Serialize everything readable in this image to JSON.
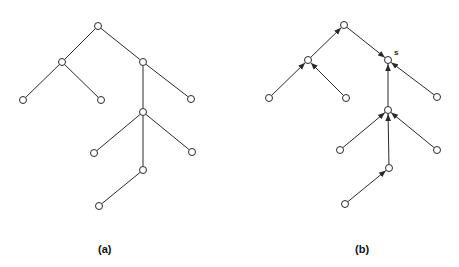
{
  "figure": {
    "panels": [
      {
        "id": "a",
        "caption": "(a)",
        "directed": false,
        "nodes": [
          {
            "id": "r",
            "x": 98,
            "y": 26
          },
          {
            "id": "l",
            "x": 62,
            "y": 62
          },
          {
            "id": "c",
            "x": 143,
            "y": 62
          },
          {
            "id": "ll",
            "x": 23,
            "y": 100
          },
          {
            "id": "lr",
            "x": 101,
            "y": 100
          },
          {
            "id": "cr",
            "x": 191,
            "y": 99
          },
          {
            "id": "m",
            "x": 143,
            "y": 112
          },
          {
            "id": "ml",
            "x": 94,
            "y": 153
          },
          {
            "id": "mr",
            "x": 192,
            "y": 152
          },
          {
            "id": "d",
            "x": 143,
            "y": 170
          },
          {
            "id": "dl",
            "x": 99,
            "y": 206
          }
        ],
        "edges": [
          [
            "r",
            "l"
          ],
          [
            "r",
            "c"
          ],
          [
            "l",
            "ll"
          ],
          [
            "l",
            "lr"
          ],
          [
            "c",
            "cr"
          ],
          [
            "c",
            "m"
          ],
          [
            "m",
            "ml"
          ],
          [
            "m",
            "mr"
          ],
          [
            "m",
            "d"
          ],
          [
            "d",
            "dl"
          ]
        ]
      },
      {
        "id": "b",
        "caption": "(b)",
        "directed": true,
        "special_node_label": "s",
        "nodes": [
          {
            "id": "r",
            "x": 344,
            "y": 25
          },
          {
            "id": "l",
            "x": 308,
            "y": 60
          },
          {
            "id": "s",
            "x": 388,
            "y": 60
          },
          {
            "id": "ll",
            "x": 269,
            "y": 98
          },
          {
            "id": "lr",
            "x": 346,
            "y": 98
          },
          {
            "id": "sr",
            "x": 437,
            "y": 97
          },
          {
            "id": "m",
            "x": 388,
            "y": 110
          },
          {
            "id": "ml",
            "x": 340,
            "y": 150
          },
          {
            "id": "mr",
            "x": 437,
            "y": 150
          },
          {
            "id": "d",
            "x": 389,
            "y": 168
          },
          {
            "id": "dl",
            "x": 345,
            "y": 204
          }
        ],
        "edges": [
          [
            "l",
            "r"
          ],
          [
            "r",
            "s"
          ],
          [
            "ll",
            "l"
          ],
          [
            "lr",
            "l"
          ],
          [
            "sr",
            "s"
          ],
          [
            "m",
            "s"
          ],
          [
            "ml",
            "m"
          ],
          [
            "mr",
            "m"
          ],
          [
            "d",
            "m"
          ],
          [
            "dl",
            "d"
          ]
        ]
      }
    ]
  }
}
